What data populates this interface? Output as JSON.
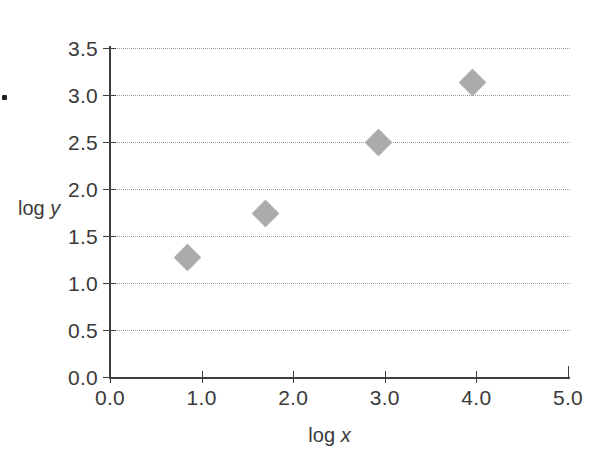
{
  "chart_data": {
    "type": "scatter",
    "title": "",
    "subtitle": "",
    "xlabel_plain": "log",
    "xlabel_italic": "x",
    "ylabel_plain": "log",
    "ylabel_italic": "y",
    "xlim": [
      0.0,
      5.0
    ],
    "ylim": [
      0.0,
      3.5
    ],
    "xticks": [
      0.0,
      1.0,
      2.0,
      3.0,
      4.0,
      5.0
    ],
    "yticks": [
      0.0,
      0.5,
      1.0,
      1.5,
      2.0,
      2.5,
      3.0,
      3.5
    ],
    "xtick_labels": [
      "0.0",
      "1.0",
      "2.0",
      "3.0",
      "4.0",
      "5.0"
    ],
    "ytick_labels": [
      "0.0",
      "0.5",
      "1.0",
      "1.5",
      "2.0",
      "2.5",
      "3.0",
      "3.5"
    ],
    "grid": {
      "horizontal": true,
      "vertical": false,
      "style": "dotted",
      "color": "#9b9b9b",
      "values": [
        0.5,
        1.0,
        1.5,
        2.0,
        2.5,
        3.0,
        3.5
      ]
    },
    "legend": {
      "visible": false,
      "position": "none"
    },
    "marker": {
      "shape": "diamond",
      "color": "#ababab",
      "size": 19
    },
    "series": [
      {
        "name": "log y vs log x",
        "points": [
          {
            "x": 0.85,
            "y": 1.27
          },
          {
            "x": 1.7,
            "y": 1.74
          },
          {
            "x": 2.93,
            "y": 2.49
          },
          {
            "x": 3.96,
            "y": 3.13
          }
        ]
      }
    ],
    "axis_color": "#3f3f3f",
    "background": "#ffffff"
  },
  "annotations": {
    "scan_speck": "scan-artifact-dot"
  }
}
